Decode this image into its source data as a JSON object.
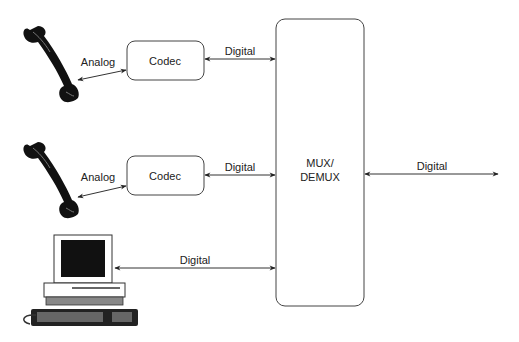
{
  "diagram": {
    "nodes": {
      "phone_1": {
        "label": "",
        "icon": "telephone-handset-icon"
      },
      "phone_2": {
        "label": "",
        "icon": "telephone-handset-icon"
      },
      "computer": {
        "label": "",
        "icon": "desktop-computer-icon"
      },
      "codec_1": {
        "label": "Codec"
      },
      "codec_2": {
        "label": "Codec"
      },
      "mux": {
        "label_line1": "MUX/",
        "label_line2": "DEMUX"
      }
    },
    "edges": {
      "phone1_codec1": {
        "label": "Analog",
        "direction": "bidirectional"
      },
      "codec1_mux": {
        "label": "Digital",
        "direction": "bidirectional"
      },
      "phone2_codec2": {
        "label": "Analog",
        "direction": "bidirectional"
      },
      "codec2_mux": {
        "label": "Digital",
        "direction": "bidirectional"
      },
      "computer_mux": {
        "label": "Digital",
        "direction": "bidirectional"
      },
      "mux_out": {
        "label": "Digital",
        "direction": "bidirectional"
      }
    },
    "colors": {
      "line": "#333333",
      "fill_dark": "#111111",
      "background": "#ffffff"
    }
  }
}
